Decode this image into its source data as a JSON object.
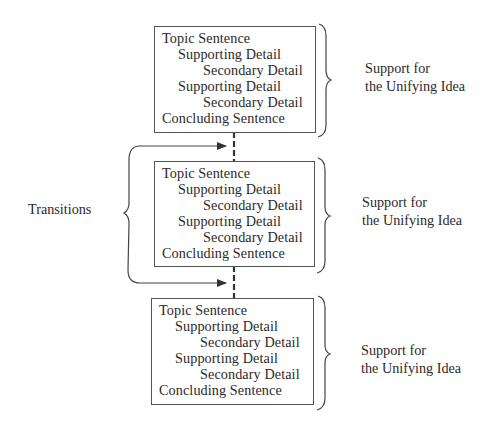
{
  "diagram": {
    "paragraphs": [
      {
        "lines": [
          {
            "text": "Topic Sentence",
            "level": 0
          },
          {
            "text": "Supporting Detail",
            "level": 1
          },
          {
            "text": "Secondary Detail",
            "level": 2
          },
          {
            "text": "Supporting Detail",
            "level": 1
          },
          {
            "text": "Secondary Detail",
            "level": 2
          },
          {
            "text": "Concluding Sentence",
            "level": 0
          }
        ],
        "label": {
          "line1": "Support for",
          "line2": "the Unifying Idea"
        }
      },
      {
        "lines": [
          {
            "text": "Topic Sentence",
            "level": 0
          },
          {
            "text": "Supporting Detail",
            "level": 1
          },
          {
            "text": "Secondary Detail",
            "level": 2
          },
          {
            "text": "Supporting Detail",
            "level": 1
          },
          {
            "text": "Secondary Detail",
            "level": 2
          },
          {
            "text": "Concluding Sentence",
            "level": 0
          }
        ],
        "label": {
          "line1": "Support for",
          "line2": "the Unifying Idea"
        }
      },
      {
        "lines": [
          {
            "text": "Topic Sentence",
            "level": 0
          },
          {
            "text": "Supporting Detail",
            "level": 1
          },
          {
            "text": "Secondary Detail",
            "level": 2
          },
          {
            "text": "Supporting Detail",
            "level": 1
          },
          {
            "text": "Secondary Detail",
            "level": 2
          },
          {
            "text": "Concluding Sentence",
            "level": 0
          }
        ],
        "label": {
          "line1": "Support for",
          "line2": "the Unifying Idea"
        }
      }
    ],
    "transitions_label": "Transitions",
    "colors": {
      "line": "#444444",
      "text": "#2a2a2a",
      "background": "#ffffff"
    }
  }
}
